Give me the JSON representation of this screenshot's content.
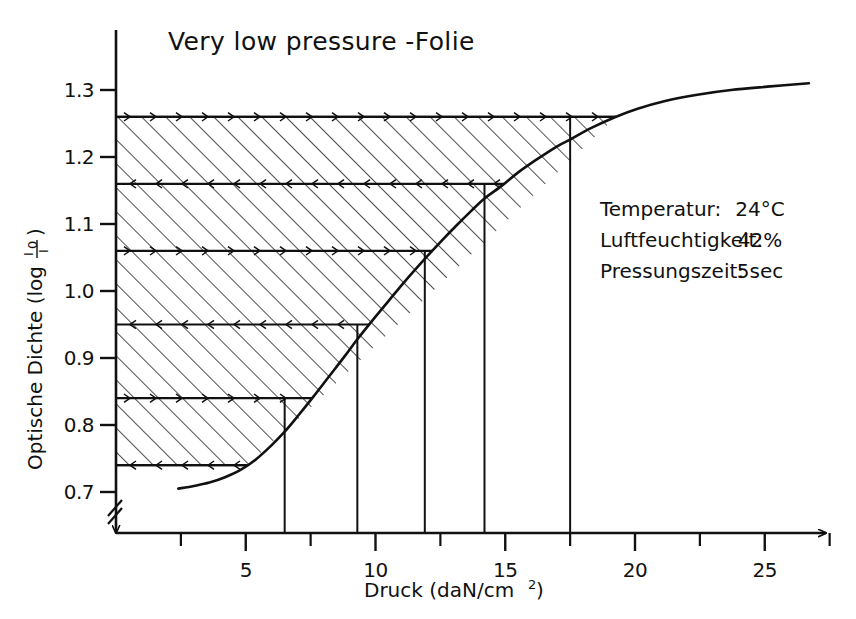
{
  "chart_data": {
    "type": "line",
    "title": "Very low pressure -Folie",
    "xlabel": "Druck (daN/cm",
    "xlabel_sup": "2",
    "xlabel_suffix": ")",
    "ylabel_prefix": "Optische Dichte (log ",
    "ylabel_frac_num": "I",
    "ylabel_frac_num_sub": "0",
    "ylabel_frac_den": "I",
    "ylabel_suffix": ")",
    "xlim": [
      0,
      27.5
    ],
    "ylim": [
      0.68,
      1.34
    ],
    "grid": false,
    "legend_position": "right-middle",
    "x_ticks_major": [
      5,
      10,
      15,
      20,
      25
    ],
    "x_ticks_major_labels": [
      "5",
      "10",
      "15",
      "20",
      "25"
    ],
    "x_ticks_minor": [
      2.5,
      7.5,
      12.5,
      17.5,
      22.5,
      27.5
    ],
    "y_ticks": [
      0.7,
      0.8,
      0.9,
      1.0,
      1.1,
      1.2,
      1.3
    ],
    "y_tick_labels": [
      "0.7",
      "0.8",
      "0.9",
      "1.0",
      "1.1",
      "1.2",
      "1.3"
    ],
    "y_axis_break": true,
    "series": [
      {
        "name": "Optische Dichte vs Druck",
        "x": [
          2.4,
          3.0,
          3.6,
          4.2,
          4.8,
          5.4,
          6.0,
          6.5,
          7.0,
          7.6,
          8.2,
          8.8,
          9.3,
          9.9,
          10.5,
          11.1,
          11.9,
          12.5,
          13.1,
          13.7,
          14.2,
          14.9,
          15.5,
          16.2,
          17.0,
          17.5,
          18.3,
          19.2,
          20.1,
          21.2,
          22.4,
          23.7,
          25.1,
          26.7
        ],
        "y": [
          0.705,
          0.709,
          0.714,
          0.722,
          0.733,
          0.749,
          0.77,
          0.79,
          0.813,
          0.842,
          0.872,
          0.902,
          0.928,
          0.957,
          0.985,
          1.013,
          1.048,
          1.073,
          1.097,
          1.12,
          1.138,
          1.158,
          1.177,
          1.196,
          1.216,
          1.226,
          1.243,
          1.259,
          1.272,
          1.284,
          1.293,
          1.3,
          1.305,
          1.31
        ]
      }
    ],
    "shaded_region": {
      "description": "hatched area left of the curve bounded above by D=1.26",
      "top_level": 1.26
    },
    "horizontal_marker_levels": [
      1.26,
      1.16,
      1.06,
      0.95,
      0.84,
      0.74
    ],
    "vertical_drop_lines": [
      {
        "x": 6.5,
        "y": 0.84
      },
      {
        "x": 9.3,
        "y": 0.95
      },
      {
        "x": 11.9,
        "y": 1.06
      },
      {
        "x": 14.2,
        "y": 1.16
      },
      {
        "x": 17.5,
        "y": 1.26
      }
    ],
    "annotations": [
      {
        "label": "Temperatur:",
        "value": "24°C"
      },
      {
        "label": "Luftfeuchtigkeit:",
        "value": "42%"
      },
      {
        "label": "Pressungszeit:",
        "value": "5sec"
      }
    ]
  },
  "legend": {
    "rows": [
      {
        "label": "Temperatur:",
        "value": "24°C"
      },
      {
        "label": "Luftfeuchtigkeit:",
        "value": "42%"
      },
      {
        "label": "Pressungszeit:",
        "value": "5sec"
      }
    ]
  },
  "colors": {
    "ink": "#111111",
    "background": "#ffffff",
    "hatch": "#222222"
  }
}
